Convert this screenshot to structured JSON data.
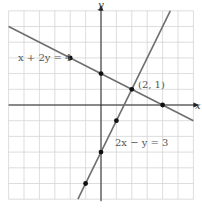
{
  "chart_data": {
    "type": "line",
    "title": "",
    "xlabel": "x",
    "ylabel": "y",
    "xlim": [
      -6,
      6
    ],
    "ylim": [
      -6,
      6
    ],
    "grid": true,
    "tick_labels_shown": false,
    "series": [
      {
        "name": "x + 2y = 4",
        "equation": "x + 2y = 4",
        "x": [
          -6,
          6
        ],
        "y": [
          5,
          -1
        ],
        "marked_points": [
          [
            -2,
            3
          ],
          [
            0,
            2
          ],
          [
            4,
            0
          ]
        ]
      },
      {
        "name": "2x − y = 3",
        "equation": "2x - y = 3",
        "x": [
          -1.5,
          4.5
        ],
        "y": [
          -6,
          6
        ],
        "marked_points": [
          [
            -1,
            -5
          ],
          [
            0,
            -3
          ],
          [
            1,
            -1
          ]
        ]
      }
    ],
    "annotations": [
      {
        "text": "(2, 1)",
        "x": 2,
        "y": 1,
        "type": "intersection"
      }
    ]
  },
  "labels": {
    "x_axis": "x",
    "y_axis": "y",
    "line1": "x + 2y = 4",
    "line2": "2x − y = 3",
    "intersection": "(2, 1)"
  },
  "colors": {
    "grid": "#d4d4d4",
    "axis": "#222222",
    "line": "#6e6e6e",
    "point": "#111111",
    "label": "#555555"
  }
}
